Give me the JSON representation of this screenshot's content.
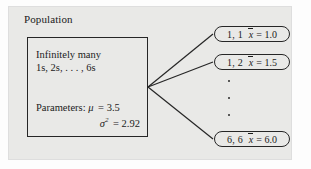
{
  "figure": {
    "title_label": "Population",
    "population_box": {
      "line1": "Infinitely many",
      "line2": "1s, 2s, . . . , 6s",
      "parameters_label": "Parameters:",
      "mu_symbol": "μ",
      "mu_value": "= 3.5",
      "sigma_symbol": "σ",
      "sigma_exponent": "2",
      "sigma_value": "= 2.92"
    },
    "samples": [
      {
        "pair": "1, 1",
        "stat_symbol": "x",
        "stat_value": "= 1.0"
      },
      {
        "pair": "1, 2",
        "stat_symbol": "x",
        "stat_value": "= 1.5"
      },
      {
        "pair": "6, 6",
        "stat_symbol": "x",
        "stat_value": "= 6.0"
      }
    ],
    "ellipsis_dots": 3,
    "colors": {
      "panel_background": "#e9e9e7",
      "stroke": "#262626",
      "text": "#1b1b1b",
      "page_background": "#fdfdfd"
    }
  }
}
